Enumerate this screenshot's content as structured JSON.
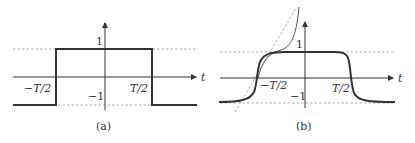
{
  "panels": [
    {
      "caption": "(a)",
      "axis_label": "t",
      "y_labels": {
        "top": "1",
        "bottom": "−1"
      },
      "x_labels": {
        "left": "−T/2",
        "right": "T/2"
      },
      "description": "Square pulse: value 1 between −T/2 and T/2, −1 outside"
    },
    {
      "caption": "(b)",
      "axis_label": "t",
      "y_labels": {
        "top": "1",
        "bottom": "−1"
      },
      "x_labels": {
        "left": "−T/2",
        "right": "T/2"
      },
      "description": "Smoothed pulse with steep sigmoid transitions; thin curve and dashed tangent line near −T/2"
    }
  ],
  "colors": {
    "curve": "#333333",
    "dashed": "#9a9a9a",
    "axis": "#333333"
  }
}
